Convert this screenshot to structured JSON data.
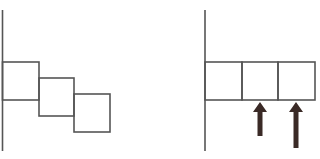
{
  "diagram": {
    "colors": {
      "line": "#555555",
      "arrow": "#3a2a26",
      "background": "#ffffff"
    },
    "left_panel": {
      "description": "staggered boxes descending diagonally from a vertical wall",
      "wall": {
        "x": 2.5,
        "y1": 10,
        "y2": 151
      },
      "boxes": [
        {
          "x": 2.5,
          "y": 62,
          "w": 36.5,
          "h": 38
        },
        {
          "x": 39,
          "y": 78,
          "w": 35,
          "h": 38
        },
        {
          "x": 74,
          "y": 94,
          "w": 36,
          "h": 38
        }
      ]
    },
    "right_panel": {
      "description": "boxes aligned horizontally from a vertical wall with upward arrows under box 2 and box 3",
      "wall": {
        "x": 205,
        "y1": 10,
        "y2": 151
      },
      "boxes": [
        {
          "x": 205,
          "y": 62,
          "w": 37,
          "h": 38
        },
        {
          "x": 242,
          "y": 62,
          "w": 36,
          "h": 38
        },
        {
          "x": 278,
          "y": 62,
          "w": 37,
          "h": 38
        }
      ],
      "arrows": [
        {
          "x": 260,
          "tip_y": 102,
          "tail_y": 136,
          "direction": "up"
        },
        {
          "x": 296,
          "tip_y": 102,
          "tail_y": 148,
          "direction": "up"
        }
      ]
    }
  }
}
